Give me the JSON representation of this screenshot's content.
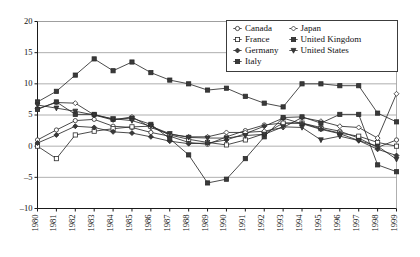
{
  "chart_data": {
    "type": "line",
    "title": "",
    "xlabel": "",
    "ylabel": "",
    "grid": true,
    "legend_position": "top-right",
    "xlim": [
      1980,
      1999
    ],
    "ylim": [
      -10,
      20
    ],
    "yticks": [
      20,
      15,
      10,
      5,
      0,
      -5,
      -10
    ],
    "categories": [
      "1980",
      "1981",
      "1982",
      "1983",
      "1984",
      "1985",
      "1986",
      "1987",
      "1988",
      "1989",
      "1990",
      "1991",
      "1992",
      "1993",
      "1994",
      "1995",
      "1996",
      "1997",
      "1998",
      "1999"
    ],
    "x": [
      1980,
      1981,
      1982,
      1983,
      1984,
      1985,
      1986,
      1987,
      1988,
      1989,
      1990,
      1991,
      1992,
      1993,
      1994,
      1995,
      1996,
      1997,
      1998,
      1999
    ],
    "series": [
      {
        "name": "Canada",
        "marker": "circle-open",
        "values": [
          1.0,
          2.6,
          4.1,
          4.3,
          3.2,
          3.0,
          2.2,
          1.6,
          0.6,
          0.3,
          1.5,
          2.5,
          3.4,
          3.7,
          3.7,
          3.0,
          2.4,
          1.3,
          -0.2,
          1.0
        ]
      },
      {
        "name": "France",
        "marker": "square-open",
        "values": [
          0.0,
          -2.0,
          1.8,
          2.4,
          2.8,
          3.1,
          3.2,
          1.8,
          1.1,
          0.6,
          0.2,
          1.0,
          2.0,
          3.7,
          3.7,
          2.8,
          2.1,
          1.6,
          0.6,
          0.0
        ]
      },
      {
        "name": "Germany",
        "marker": "diamond-fill",
        "values": [
          0.5,
          1.8,
          3.2,
          3.0,
          2.3,
          2.1,
          1.5,
          0.8,
          0.4,
          0.5,
          1.0,
          2.0,
          3.2,
          4.5,
          3.6,
          2.7,
          2.0,
          0.9,
          -0.5,
          -1.5
        ]
      },
      {
        "name": "Italy",
        "marker": "square-fill",
        "values": [
          7.1,
          8.8,
          11.4,
          14.0,
          12.1,
          13.5,
          11.8,
          10.6,
          10.0,
          9.0,
          9.3,
          8.0,
          6.9,
          6.3,
          10.0,
          10.0,
          9.7,
          9.7,
          5.3,
          3.9
        ]
      },
      {
        "name": "Japan",
        "marker": "diamond-open",
        "values": [
          6.0,
          7.0,
          6.9,
          5.0,
          4.2,
          4.7,
          3.0,
          1.9,
          1.5,
          1.5,
          2.2,
          2.2,
          2.4,
          3.0,
          4.6,
          4.0,
          3.2,
          3.0,
          1.3,
          8.4
        ]
      },
      {
        "name": "United Kingdom",
        "marker": "square-fill",
        "values": [
          5.9,
          7.1,
          5.1,
          5.1,
          4.3,
          4.5,
          3.5,
          1.2,
          -1.4,
          -5.9,
          -5.3,
          -2.0,
          1.5,
          4.6,
          4.7,
          3.7,
          5.1,
          5.1,
          -3.0,
          -4.1
        ]
      },
      {
        "name": "United States",
        "marker": "triangle-fill",
        "values": [
          6.6,
          6.1,
          5.6,
          5.0,
          4.4,
          4.1,
          3.2,
          2.0,
          1.4,
          1.3,
          1.3,
          1.7,
          1.9,
          3.1,
          3.0,
          1.0,
          1.6,
          0.9,
          0.0,
          -2.1
        ]
      }
    ]
  },
  "legend": {
    "columns": [
      [
        {
          "label": "Canada",
          "marker": "circle-open"
        },
        {
          "label": "France",
          "marker": "square-open"
        },
        {
          "label": "Germany",
          "marker": "diamond-fill"
        },
        {
          "label": "Italy",
          "marker": "square-fill"
        }
      ],
      [
        {
          "label": "Japan",
          "marker": "diamond-open"
        },
        {
          "label": "United Kingdom",
          "marker": "square-fill"
        },
        {
          "label": "United States",
          "marker": "triangle-fill"
        }
      ]
    ]
  },
  "colors": {
    "line": "#2b2b2b",
    "grid": "#9a9a9a",
    "axis": "#1a1a1a",
    "background": "#ffffff"
  }
}
